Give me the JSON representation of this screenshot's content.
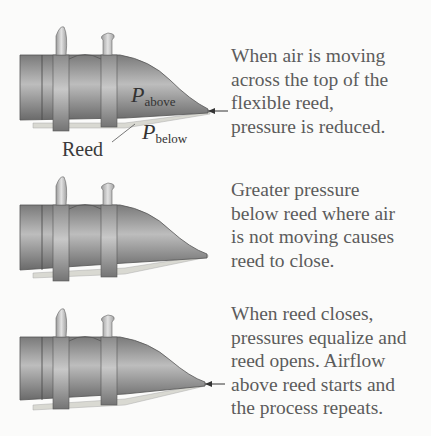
{
  "panels": [
    {
      "caption": "When air is moving\nacross the top of the\nflexible reed,\npressure is reduced.",
      "labels": {
        "p_above_symbol": "P",
        "p_above_sub": "above",
        "p_below_symbol": "P",
        "p_below_sub": "below",
        "reed": "Reed"
      },
      "airflow_arrow": true,
      "reed_state": "open"
    },
    {
      "caption": "Greater pressure\nbelow reed where air\nis not moving causes\nreed to close.",
      "airflow_arrow": false,
      "reed_state": "closed"
    },
    {
      "caption": "When reed closes,\npressures equalize and\nreed opens.  Airflow\nabove reed starts and\nthe process repeats.",
      "airflow_arrow": true,
      "reed_state": "reopening"
    }
  ],
  "colors": {
    "background": "#fbfbfa",
    "body_dark": "#6e6e6e",
    "body_light": "#b8b8b8",
    "reed": "#d9d9d2",
    "text": "#5c5c5c"
  }
}
